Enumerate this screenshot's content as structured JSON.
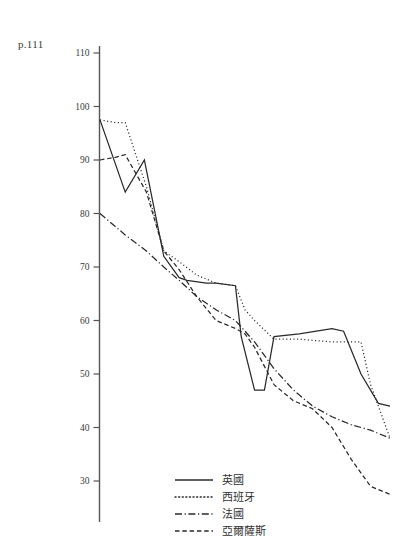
{
  "page_reference": "p.111",
  "chart_data": {
    "type": "line",
    "title": "",
    "xlabel": "",
    "ylabel": "",
    "ylim": [
      25,
      113
    ],
    "xlim": [
      0,
      100
    ],
    "grid": false,
    "y_ticks": [
      110,
      100,
      90,
      80,
      70,
      60,
      50,
      40,
      30
    ],
    "x_ticks": [],
    "x_tick_labels": [],
    "legend_position": "bottom-right",
    "series": [
      {
        "name": "英國",
        "style": "solid",
        "x": [
          0,
          8.7,
          15.3,
          22.0,
          27.3,
          30.0,
          36.7,
          40.0,
          46.7,
          48.7,
          53.3,
          56.7,
          60.0,
          68.7,
          80.0,
          84.0,
          90.0,
          96.0,
          100.0
        ],
        "y": [
          97.5,
          84.0,
          90.0,
          72.0,
          68.0,
          67.5,
          67.0,
          67.0,
          66.5,
          57.0,
          47.0,
          47.0,
          57.0,
          57.5,
          58.5,
          58.0,
          50.0,
          44.5,
          44.0
        ]
      },
      {
        "name": "西班牙",
        "style": "dotted",
        "x": [
          0,
          5.3,
          8.7,
          16.0,
          22.0,
          27.3,
          33.3,
          40.0,
          46.7,
          50.0,
          53.3,
          60.0,
          68.7,
          80.0,
          90.0,
          93.3,
          100.0
        ],
        "y": [
          97.5,
          97.0,
          97.0,
          85.0,
          73.0,
          71.0,
          68.5,
          67.0,
          66.5,
          62.0,
          60.0,
          56.5,
          56.5,
          56.0,
          56.0,
          48.0,
          38.0
        ]
      },
      {
        "name": "法國",
        "style": "dashdot",
        "x": [
          0,
          8.7,
          16.0,
          22.0,
          27.3,
          33.3,
          40.0,
          46.7,
          53.3,
          60.0,
          66.7,
          73.3,
          80.0,
          86.7,
          93.3,
          100.0
        ],
        "y": [
          80.0,
          76.0,
          73.0,
          70.0,
          67.5,
          64.5,
          62.0,
          60.0,
          56.0,
          51.0,
          47.0,
          44.0,
          42.0,
          40.5,
          39.5,
          38.0
        ]
      },
      {
        "name": "亞爾薩斯",
        "style": "dashed",
        "x": [
          0,
          5.3,
          8.7,
          16.0,
          22.0,
          27.3,
          33.3,
          40.0,
          46.7,
          50.0,
          53.3,
          60.0,
          66.7,
          73.3,
          80.0,
          86.7,
          93.3,
          100.0
        ],
        "y": [
          90.0,
          90.5,
          91.0,
          84.0,
          73.0,
          69.5,
          64.5,
          60.0,
          58.5,
          57.5,
          55.0,
          48.0,
          45.0,
          43.5,
          40.0,
          34.0,
          29.0,
          27.5
        ]
      }
    ],
    "legend": [
      {
        "label": "英國",
        "style": "solid"
      },
      {
        "label": "西班牙",
        "style": "dotted"
      },
      {
        "label": "法國",
        "style": "dashdot"
      },
      {
        "label": "亞爾薩斯",
        "style": "dashed"
      }
    ]
  }
}
